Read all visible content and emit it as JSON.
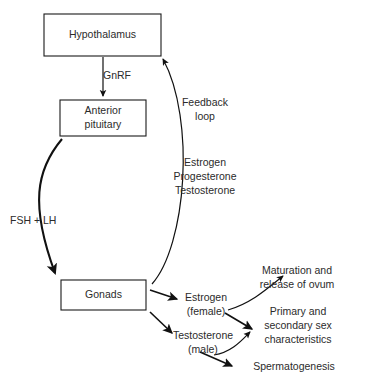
{
  "diagram": {
    "type": "flow-diagram",
    "background_color": "#ffffff",
    "line_color": "#111111",
    "text_color": "#2b2b2b",
    "boxes": [
      {
        "id": "hypothalamus",
        "label": "Hypothalamus",
        "lines": [
          "Hypothalamus"
        ],
        "x": 44,
        "y": 14,
        "w": 117,
        "h": 42
      },
      {
        "id": "anterior-pituitary",
        "label": "Anterior pituitary",
        "lines": [
          "Anterior",
          "pituitary"
        ],
        "x": 60,
        "y": 100,
        "w": 86,
        "h": 36
      },
      {
        "id": "gonads",
        "label": "Gonads",
        "lines": [
          "Gonads"
        ],
        "x": 61,
        "y": 280,
        "w": 85,
        "h": 30
      }
    ],
    "labels": [
      {
        "id": "gnrf",
        "text": "GnRF",
        "x": 103,
        "y": 76,
        "align": "start"
      },
      {
        "id": "feedback-loop-1",
        "text": "Feedback",
        "x": 205,
        "y": 103,
        "align": "center"
      },
      {
        "id": "feedback-loop-2",
        "text": "loop",
        "x": 205,
        "y": 117,
        "align": "center"
      },
      {
        "id": "estrogen-fb",
        "text": "Estrogen",
        "x": 205,
        "y": 163,
        "align": "center"
      },
      {
        "id": "progesterone-fb",
        "text": "Progesterone",
        "x": 205,
        "y": 177,
        "align": "center"
      },
      {
        "id": "testosterone-fb",
        "text": "Testosterone",
        "x": 205,
        "y": 191,
        "align": "center"
      },
      {
        "id": "fsh-lh",
        "text": "FSH + LH",
        "x": 10,
        "y": 221,
        "align": "start"
      },
      {
        "id": "estrogen-f-1",
        "text": "Estrogen",
        "x": 206,
        "y": 298,
        "align": "center"
      },
      {
        "id": "estrogen-f-2",
        "text": "(female)",
        "x": 206,
        "y": 312,
        "align": "center"
      },
      {
        "id": "testosterone-m-1",
        "text": "Testosterone",
        "x": 203,
        "y": 336,
        "align": "center"
      },
      {
        "id": "testosterone-m-2",
        "text": "(male)",
        "x": 203,
        "y": 350,
        "align": "center"
      },
      {
        "id": "ovum-1",
        "text": "Maturation and",
        "x": 297,
        "y": 271,
        "align": "center"
      },
      {
        "id": "ovum-2",
        "text": "release of ovum",
        "x": 297,
        "y": 285,
        "align": "center"
      },
      {
        "id": "sexchar-1",
        "text": "Primary and",
        "x": 298,
        "y": 312,
        "align": "center"
      },
      {
        "id": "sexchar-2",
        "text": "secondary sex",
        "x": 298,
        "y": 326,
        "align": "center"
      },
      {
        "id": "sexchar-3",
        "text": "characteristics",
        "x": 298,
        "y": 340,
        "align": "center"
      },
      {
        "id": "spermatogenesis",
        "text": "Spermatogenesis",
        "x": 294,
        "y": 367,
        "align": "center"
      }
    ],
    "connectors": [
      {
        "id": "hypothalamus-to-pituitary",
        "from": "hypothalamus",
        "to": "anterior-pituitary",
        "label": "GnRF",
        "path": "M 103 57 L 103 96",
        "weight": "thin",
        "arrow": "end"
      },
      {
        "id": "pituitary-to-gonads",
        "from": "anterior-pituitary",
        "to": "gonads",
        "label": "FSH + LH",
        "path": "M 62 139 C 36 170, 30 205, 55 273",
        "weight": "thick",
        "arrow": "end"
      },
      {
        "id": "gonads-to-hypothalamus",
        "from": "gonads",
        "to": "hypothalamus",
        "label": "Feedback loop",
        "path": "M 152 284 C 186 246, 196 120, 163 59",
        "weight": "thin",
        "arrow": "end"
      },
      {
        "id": "gonads-to-estrogen",
        "from": "gonads",
        "to": "estrogen-female",
        "path": "M 150 290 L 177 299",
        "weight": "medium",
        "arrow": "end"
      },
      {
        "id": "gonads-to-testosterone",
        "from": "gonads",
        "to": "testosterone-male",
        "path": "M 150 312 L 172 333",
        "weight": "medium",
        "arrow": "end"
      },
      {
        "id": "estrogen-to-ovum",
        "from": "estrogen-female",
        "to": "maturation-release-ovum",
        "path": "M 228 310 C 252 303, 268 288, 283 276",
        "weight": "thin",
        "arrow": "end"
      },
      {
        "id": "estrogen-to-sexchar",
        "from": "estrogen-female",
        "to": "sex-characteristics",
        "path": "M 225 313 L 252 329",
        "weight": "medium",
        "arrow": "end"
      },
      {
        "id": "testosterone-to-sexchar",
        "from": "testosterone-male",
        "to": "sex-characteristics",
        "path": "M 214 355 C 232 352, 242 340, 250 332",
        "weight": "thin",
        "arrow": "end"
      },
      {
        "id": "testosterone-to-spermatogenesis",
        "from": "testosterone-male",
        "to": "spermatogenesis",
        "path": "M 200 352 L 232 366",
        "weight": "medium",
        "arrow": "end"
      }
    ]
  }
}
